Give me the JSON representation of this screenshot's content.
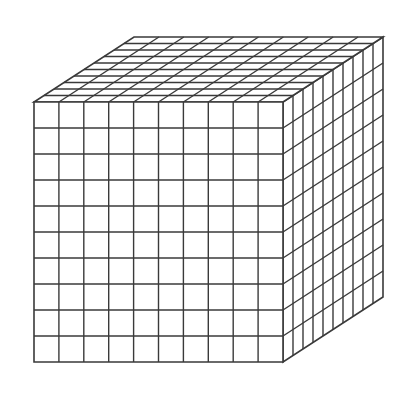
{
  "figure": {
    "grid": {
      "columns": 10,
      "rows": 10,
      "depth": 10
    },
    "geometry": {
      "front_top_left": [
        34,
        102
      ],
      "front_width": 249,
      "front_height": 260,
      "depth_offset": [
        100,
        -65
      ]
    },
    "colors": {
      "background": "#ffffff",
      "face_fill": "#ffffff",
      "line": "#3a3a3a"
    }
  }
}
